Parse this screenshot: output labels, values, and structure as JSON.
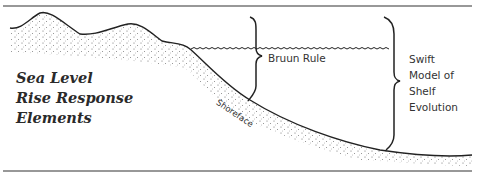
{
  "diagram": {
    "title_lines": [
      "Sea Level",
      "Rise Response",
      "Elements"
    ],
    "labels": {
      "bruun_rule": "Bruun Rule",
      "swift_model_lines": [
        "Swift",
        "Model of",
        "Shelf",
        "Evolution"
      ],
      "shoreface": "Shoreface"
    },
    "elements": [
      "top-border",
      "bottom-border",
      "land-profile",
      "sea-level-wave-line",
      "bruun-rule-brace",
      "swift-model-brace",
      "sediment-stipple"
    ],
    "colors": {
      "line": "#222222",
      "text": "#333333",
      "stipple": "#555555",
      "background": "#ffffff"
    }
  }
}
